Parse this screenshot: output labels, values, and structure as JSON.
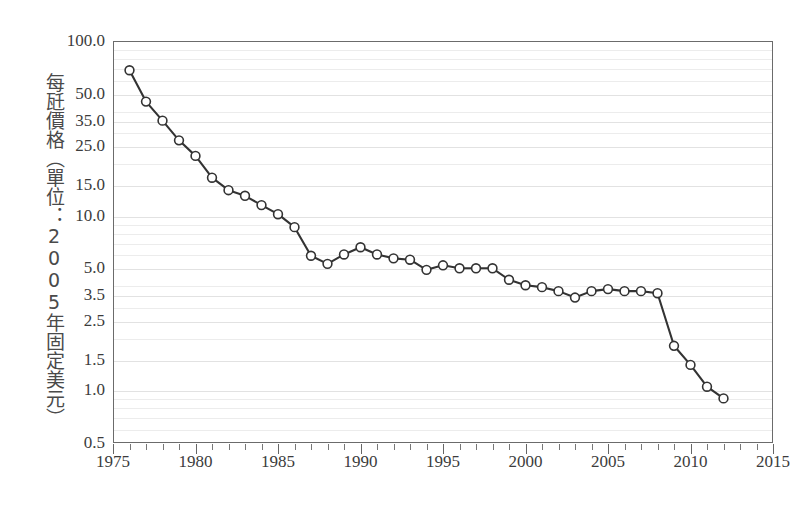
{
  "chart_data": {
    "type": "line",
    "title": "",
    "subtitle": "",
    "xlabel": "",
    "ylabel": "每瓩價格（單位：2005年固定美元）",
    "yscale": "log",
    "xscale": "linear",
    "xlim": [
      1975,
      2015
    ],
    "ylim": [
      0.5,
      100.0
    ],
    "grid": true,
    "legend": false,
    "legend_position": "none",
    "x_tick_labels": [
      "1975",
      "1980",
      "1985",
      "1990",
      "1995",
      "2000",
      "2005",
      "2010",
      "2015"
    ],
    "x_tick_values": [
      1975,
      1980,
      1985,
      1990,
      1995,
      2000,
      2005,
      2010,
      2015
    ],
    "x_minor_tick_interval": 1,
    "y_tick_labels": [
      "100.0",
      "50.0",
      "35.0",
      "25.0",
      "15.0",
      "10.0",
      "5.0",
      "3.5",
      "2.5",
      "1.5",
      "1.0",
      "0.5"
    ],
    "y_tick_values": [
      100.0,
      50.0,
      35.0,
      25.0,
      15.0,
      10.0,
      5.0,
      3.5,
      2.5,
      1.5,
      1.0,
      0.5
    ],
    "series": [
      {
        "name": "每瓩價格",
        "marker": "circle-open",
        "line_color": "#333333",
        "marker_fill": "#ffffff",
        "marker_edge": "#333333",
        "x": [
          1976,
          1977,
          1978,
          1979,
          1980,
          1981,
          1982,
          1983,
          1984,
          1985,
          1986,
          1987,
          1988,
          1989,
          1990,
          1991,
          1992,
          1993,
          1994,
          1995,
          1996,
          1997,
          1998,
          1999,
          2000,
          2001,
          2002,
          2003,
          2004,
          2005,
          2006,
          2007,
          2008,
          2009,
          2010,
          2011,
          2012
        ],
        "y": [
          68.0,
          45.0,
          35.0,
          27.0,
          22.0,
          16.5,
          14.0,
          13.0,
          11.5,
          10.2,
          8.6,
          5.9,
          5.3,
          6.0,
          6.6,
          6.0,
          5.7,
          5.6,
          4.9,
          5.2,
          5.0,
          5.0,
          5.0,
          4.3,
          4.0,
          3.9,
          3.7,
          3.4,
          3.7,
          3.8,
          3.7,
          3.7,
          3.6,
          1.8,
          1.4,
          1.05,
          0.9
        ]
      }
    ]
  },
  "axis": {
    "y_title": "每瓩價格（單位：2005年固定美元）"
  }
}
